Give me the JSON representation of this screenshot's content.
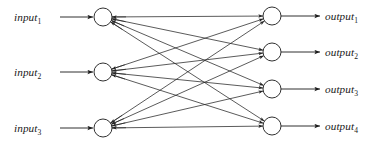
{
  "diagram": {
    "kind": "fully-connected-neural-network",
    "stroke_color": "#1a1a1a",
    "edge_color": "#242424",
    "background_color": "#ffffff",
    "node_radius": 9
  },
  "input_layer": {
    "name": "input-layer",
    "count": 3,
    "nodes": [
      {
        "id": "in1",
        "label_base": "input",
        "label_sub": "1",
        "cx": 103,
        "cy": 17
      },
      {
        "id": "in2",
        "label_base": "input",
        "label_sub": "2",
        "cx": 103,
        "cy": 72
      },
      {
        "id": "in3",
        "label_base": "input",
        "label_sub": "3",
        "cx": 103,
        "cy": 128
      }
    ],
    "labels": [
      {
        "text_base": "input",
        "text_sub": "1",
        "x": 14,
        "y": 21
      },
      {
        "text_base": "input",
        "text_sub": "2",
        "x": 14,
        "y": 76
      },
      {
        "text_base": "input",
        "text_sub": "3",
        "x": 14,
        "y": 132
      }
    ],
    "incoming_arrows": [
      {
        "x1": 60,
        "y1": 17,
        "x2": 93,
        "y2": 17
      },
      {
        "x1": 60,
        "y1": 72,
        "x2": 93,
        "y2": 72
      },
      {
        "x1": 60,
        "y1": 128,
        "x2": 93,
        "y2": 128
      }
    ]
  },
  "output_layer": {
    "name": "output-layer",
    "count": 4,
    "nodes": [
      {
        "id": "out1",
        "label_base": "output",
        "label_sub": "1",
        "cx": 272,
        "cy": 16
      },
      {
        "id": "out2",
        "label_base": "output",
        "label_sub": "2",
        "cx": 272,
        "cy": 52
      },
      {
        "id": "out3",
        "label_base": "output",
        "label_sub": "3",
        "cx": 272,
        "cy": 89
      },
      {
        "id": "out4",
        "label_base": "output",
        "label_sub": "4",
        "cx": 272,
        "cy": 126
      }
    ],
    "labels": [
      {
        "text_base": "output",
        "text_sub": "1",
        "x": 325,
        "y": 20
      },
      {
        "text_base": "output",
        "text_sub": "2",
        "x": 325,
        "y": 56
      },
      {
        "text_base": "output",
        "text_sub": "3",
        "x": 325,
        "y": 93
      },
      {
        "text_base": "output",
        "text_sub": "4",
        "x": 325,
        "y": 130
      }
    ],
    "outgoing_arrows": [
      {
        "x1": 281,
        "y1": 16,
        "x2": 320,
        "y2": 16
      },
      {
        "x1": 281,
        "y1": 52,
        "x2": 320,
        "y2": 52
      },
      {
        "x1": 281,
        "y1": 89,
        "x2": 320,
        "y2": 89
      },
      {
        "x1": 281,
        "y1": 126,
        "x2": 320,
        "y2": 126
      }
    ]
  },
  "connections": {
    "name": "fully-connected-edges",
    "total": 12,
    "description": "every input node connects to every output node",
    "edges": [
      {
        "from": "in1",
        "to": "out1"
      },
      {
        "from": "in1",
        "to": "out2"
      },
      {
        "from": "in1",
        "to": "out3"
      },
      {
        "from": "in1",
        "to": "out4"
      },
      {
        "from": "in2",
        "to": "out1"
      },
      {
        "from": "in2",
        "to": "out2"
      },
      {
        "from": "in2",
        "to": "out3"
      },
      {
        "from": "in2",
        "to": "out4"
      },
      {
        "from": "in3",
        "to": "out1"
      },
      {
        "from": "in3",
        "to": "out2"
      },
      {
        "from": "in3",
        "to": "out3"
      },
      {
        "from": "in3",
        "to": "out4"
      }
    ]
  }
}
